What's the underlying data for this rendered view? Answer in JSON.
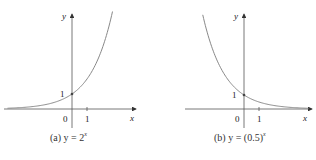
{
  "chart_data": [
    {
      "type": "line",
      "title": "(a) y = 2^x",
      "caption_prefix": "(a) y = 2",
      "caption_exp": "x",
      "xlabel": "x",
      "ylabel": "y",
      "function": "2^x",
      "x": [
        -4,
        -3,
        -2,
        -1,
        0,
        1,
        2,
        2.5
      ],
      "values": [
        0.0625,
        0.125,
        0.25,
        0.5,
        1,
        2,
        4,
        5.66
      ],
      "marked_point": {
        "x": 0,
        "y": 1
      },
      "tick_labels": {
        "origin": "0",
        "x_tick": "1",
        "y_tick": "1"
      },
      "grid": false,
      "curve_color": "#888888"
    },
    {
      "type": "line",
      "title": "(b) y = (0.5)^x",
      "caption_prefix": "(b) y = (0.5)",
      "caption_exp": "x",
      "xlabel": "x",
      "ylabel": "y",
      "function": "(0.5)^x",
      "x": [
        -2.5,
        -2,
        -1,
        0,
        1,
        2,
        3,
        4
      ],
      "values": [
        5.66,
        4,
        2,
        1,
        0.5,
        0.25,
        0.125,
        0.0625
      ],
      "marked_point": {
        "x": 0,
        "y": 1
      },
      "tick_labels": {
        "origin": "0",
        "x_tick": "1",
        "y_tick": "1"
      },
      "grid": false,
      "curve_color": "#888888"
    }
  ]
}
